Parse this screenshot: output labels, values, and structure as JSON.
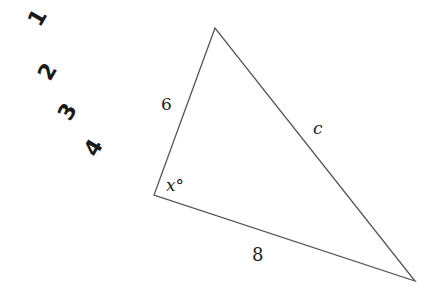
{
  "figure": {
    "type": "triangle",
    "vertices": {
      "top": [
        215,
        28
      ],
      "left": [
        154,
        195
      ],
      "right": [
        415,
        281
      ]
    },
    "line_color": "#555555",
    "labels": {
      "side_left": "6",
      "side_right": "c",
      "side_bottom": "8",
      "angle": "x°"
    }
  },
  "handwriting": {
    "marks": [
      "1",
      "2",
      "3",
      "4"
    ],
    "color": "#1a1a1a"
  }
}
